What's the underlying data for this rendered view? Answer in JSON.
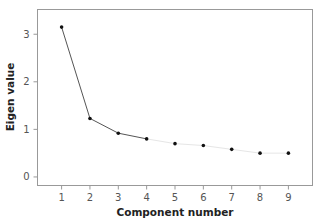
{
  "chart_data": {
    "type": "line",
    "title": "",
    "xlabel": "Component number",
    "ylabel": "Eigen value",
    "x": [
      1,
      2,
      3,
      4,
      5,
      6,
      7,
      8,
      9
    ],
    "series": [
      {
        "name": "Eigen value",
        "values": [
          3.15,
          1.23,
          0.92,
          0.8,
          0.7,
          0.66,
          0.58,
          0.5,
          0.5
        ]
      }
    ],
    "x_ticks": [
      "1",
      "2",
      "3",
      "4",
      "5",
      "6",
      "7",
      "8",
      "9"
    ],
    "y_ticks": [
      "0",
      "1",
      "2",
      "3"
    ],
    "xlim": [
      0.15,
      9.85
    ],
    "ylim": [
      -0.18,
      3.52
    ],
    "grid": false,
    "legend": "none",
    "line_style_note": "dark line for components 1-4, very faint light-gray line for components 4-9",
    "colors": {
      "line_strong": "#555555",
      "line_faint": "#e6e6e6",
      "marker": "#111111",
      "frame": "#999999"
    }
  }
}
